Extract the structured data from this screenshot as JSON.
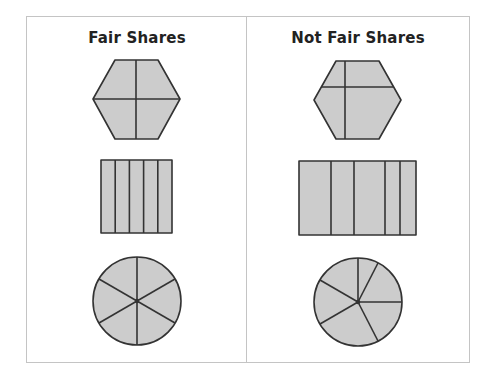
{
  "panels": [
    {
      "title": "Fair Shares",
      "shapes": [
        {
          "type": "hexagon",
          "parts": 4,
          "equal": true
        },
        {
          "type": "rectangle",
          "parts": 5,
          "equal": true
        },
        {
          "type": "circle",
          "parts": 6,
          "equal": true
        }
      ]
    },
    {
      "title": "Not Fair Shares",
      "shapes": [
        {
          "type": "hexagon",
          "parts": 4,
          "equal": false
        },
        {
          "type": "rectangle",
          "parts": 5,
          "equal": false
        },
        {
          "type": "circle",
          "parts": 6,
          "equal": false
        }
      ]
    }
  ],
  "colors": {
    "fill": "#cccccc",
    "stroke": "#333333",
    "frame": "#c4c4c4"
  }
}
